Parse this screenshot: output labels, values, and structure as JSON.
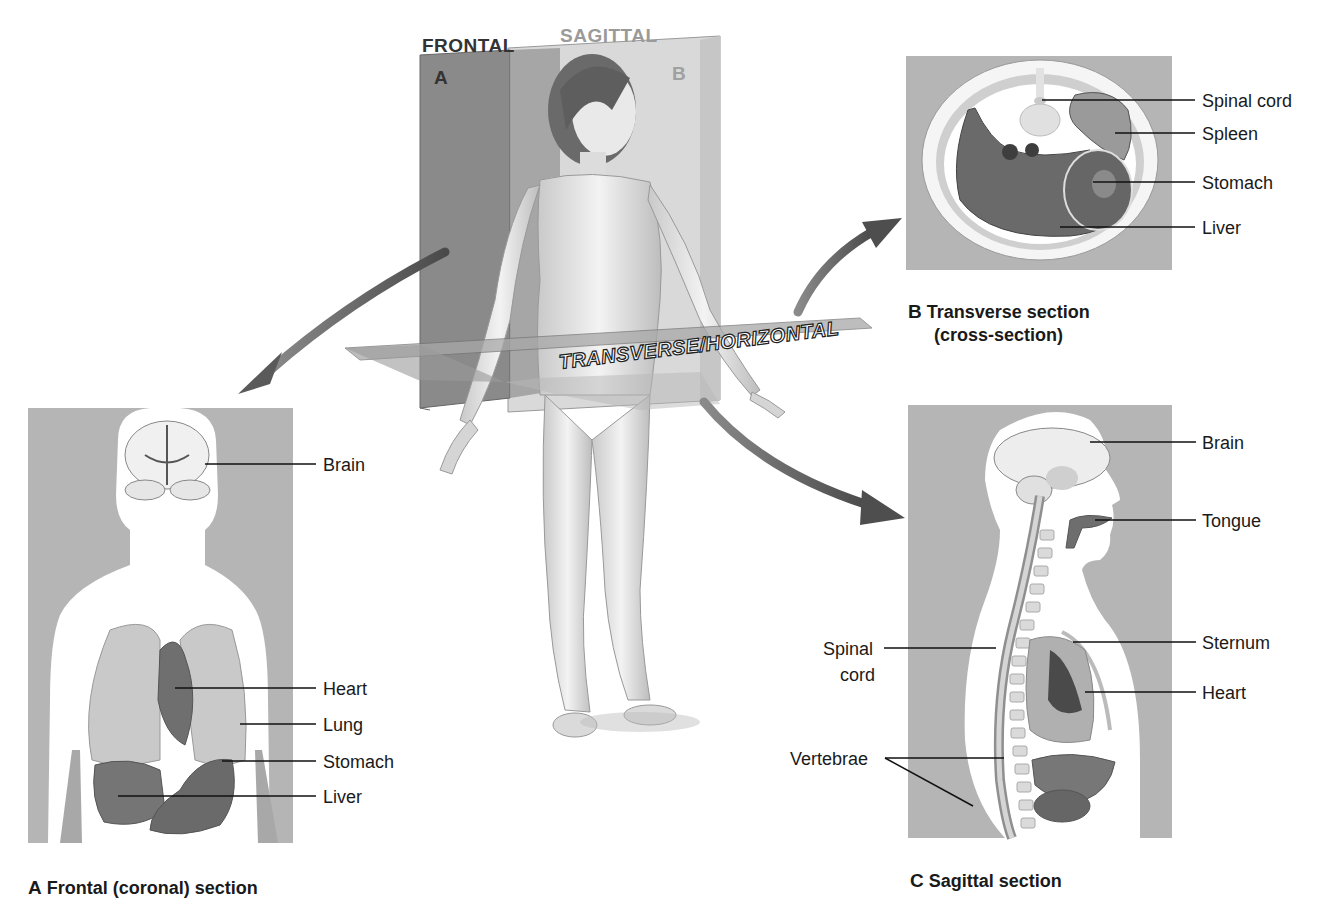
{
  "planes": {
    "frontal_label": "FRONTAL",
    "sagittal_label": "SAGITTAL",
    "transverse_label": "TRANSVERSE/HORIZONTAL",
    "frontal_letter": "A",
    "sagittal_letter": "B"
  },
  "panel_a": {
    "caption_letter": "A",
    "caption_text": "Frontal (coronal) section",
    "labels": [
      "Brain",
      "Heart",
      "Lung",
      "Stomach",
      "Liver"
    ]
  },
  "panel_b": {
    "caption_letter": "B",
    "caption_line1": "Transverse section",
    "caption_line2": "(cross-section)",
    "labels": [
      "Spinal cord",
      "Spleen",
      "Stomach",
      "Liver"
    ]
  },
  "panel_c": {
    "caption_letter": "C",
    "caption_text": "Sagittal section",
    "labels": [
      "Brain",
      "Tongue",
      "Sternum",
      "Heart",
      "Vertebrae"
    ],
    "spinal_cord_line1": "Spinal",
    "spinal_cord_line2": "cord"
  },
  "colors": {
    "panel_bg": "#b5b5b5",
    "body_fill": "#ffffff",
    "organ_dark": "#6e6e6e",
    "organ_mid": "#9a9a9a",
    "plane_fill": "#8f8f8f",
    "arrow": "#5a5a5a"
  }
}
